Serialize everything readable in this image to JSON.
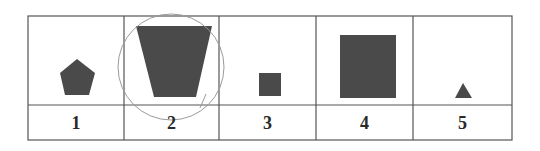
{
  "figure": {
    "table": {
      "left": 28,
      "top": 16,
      "right": 512,
      "bottom": 140,
      "row_divider": 105,
      "column_lines": [
        124,
        219,
        316,
        413
      ],
      "line_color": "#555555",
      "shape_color": "#4a4a4a",
      "circle_color": "#9a9a9a"
    },
    "cells": [
      {
        "label": "1",
        "shape": "pentagon",
        "x0": 28,
        "x1": 124
      },
      {
        "label": "2",
        "shape": "inverted-trapezoid",
        "x0": 124,
        "x1": 219,
        "circled": true
      },
      {
        "label": "3",
        "shape": "small-square",
        "x0": 219,
        "x1": 316
      },
      {
        "label": "4",
        "shape": "large-square",
        "x0": 316,
        "x1": 413
      },
      {
        "label": "5",
        "shape": "triangle",
        "x0": 413,
        "x1": 512
      }
    ]
  }
}
